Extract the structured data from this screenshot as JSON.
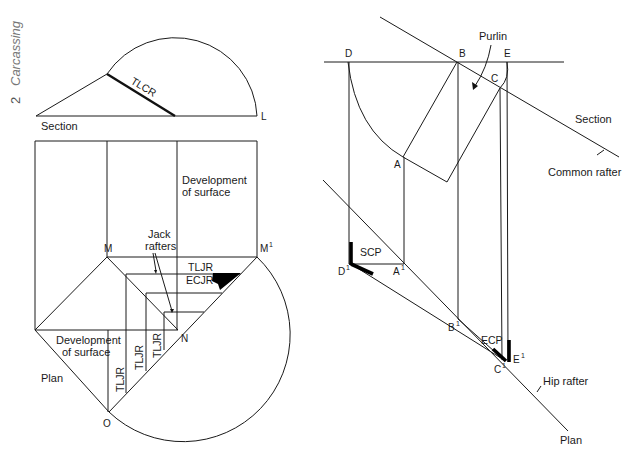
{
  "page": {
    "chapter_number": "2",
    "chapter_title": "Carcassing"
  },
  "left_figure": {
    "section": {
      "label": "Section",
      "rafter_label": "TLCR",
      "point_L": "L"
    },
    "development": {
      "upper_label_line1": "Development",
      "upper_label_line2": "of surface",
      "lower_label_line1": "Development",
      "lower_label_line2": "of surface",
      "jack_rafters_line1": "Jack",
      "jack_rafters_line2": "rafters",
      "tljr_top": "TLJR",
      "ecjr": "ECJR",
      "tljr_vertical": [
        "TLJR",
        "TLJR",
        "TLJR"
      ],
      "plan_label": "Plan"
    },
    "points": {
      "M": "M",
      "M1": "M",
      "M1_sup": "1",
      "N": "N",
      "O": "O"
    }
  },
  "right_figure": {
    "labels": {
      "purlin": "Purlin",
      "section": "Section",
      "common_rafter": "Common rafter",
      "hip_rafter": "Hip rafter",
      "plan": "Plan",
      "scp": "SCP",
      "ecp": "ECP"
    },
    "points": {
      "D": "D",
      "B": "B",
      "E": "E",
      "C": "C",
      "A": "A",
      "D1": "D",
      "A1": "A",
      "B1": "B",
      "C1": "C",
      "E1": "E",
      "sup": "1"
    }
  }
}
